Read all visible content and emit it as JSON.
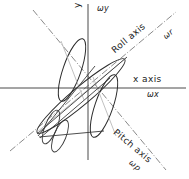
{
  "diagram": {
    "background_color": "#ffffff",
    "axis_color": "#4a4a4a",
    "rotation_axis_color": "#8a8a8a",
    "aircraft_outline_color": "#2b2b2b",
    "labels": {
      "y_axis": "y axis",
      "omega_y": "ωy",
      "x_axis": "x axis",
      "omega_x": "ωx",
      "roll_axis": "Roll axis",
      "omega_r": "ωr",
      "pitch_axis": "Pitch axis",
      "omega_p": "ωp"
    },
    "axes": [
      {
        "name": "x-axis",
        "style": "solid",
        "label": "x axis",
        "rate_symbol": "ωx",
        "orientation_deg": 0
      },
      {
        "name": "y-axis",
        "style": "solid",
        "label": "y axis",
        "rate_symbol": "ωy",
        "orientation_deg": 90
      },
      {
        "name": "roll-axis",
        "style": "dash-dot",
        "label": "Roll axis",
        "rate_symbol": "ωr",
        "orientation_deg": 40
      },
      {
        "name": "pitch-axis",
        "style": "dash-dot",
        "label": "Pitch axis",
        "rate_symbol": "ωp",
        "orientation_deg": -40
      }
    ],
    "aircraft": {
      "description": "Line drawing of an aircraft composed of elongated ellipses: fuselage aligned with the roll axis, wings aligned with the pitch axis, and crossed tail surfaces at the rear lower-left.",
      "parts": [
        "fuselage",
        "left-wing",
        "right-wing",
        "horizontal-tail",
        "vertical-tail"
      ]
    }
  }
}
